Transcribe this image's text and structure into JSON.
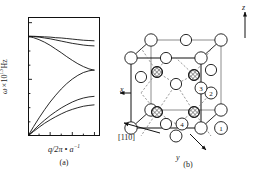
{
  "figure": {
    "panel_a_caption": "(a)",
    "panel_b_caption": "(b)"
  },
  "chart_data": {
    "type": "line",
    "title": "",
    "xlabel": "q/2π · a⁻¹",
    "ylabel": "ω × 10¹³ Hz",
    "xlim": [
      0,
      3.25
    ],
    "ylim": [
      0,
      4.2
    ],
    "grid": false,
    "legend": "none",
    "xticks": [
      1,
      2,
      3
    ],
    "xticklabels": [
      "1",
      "2",
      "3"
    ],
    "xminorticks": [
      0.5,
      1.5,
      2.5
    ],
    "yticks": [
      0,
      2,
      4
    ],
    "yticklabels": [
      "0",
      "2",
      "4"
    ],
    "yminorticks": [
      0.5,
      1,
      1.5,
      2.5,
      3,
      3.5
    ],
    "x": [
      0,
      0.25,
      0.5,
      0.75,
      1.0,
      1.25,
      1.5,
      1.75,
      2.0,
      2.25,
      2.5,
      2.75,
      3.0
    ],
    "series": [
      {
        "name": "LO",
        "branch": "optical",
        "values": [
          3.52,
          3.52,
          3.51,
          3.5,
          3.49,
          3.47,
          3.46,
          3.44,
          3.42,
          3.4,
          3.38,
          3.37,
          3.36
        ]
      },
      {
        "name": "TO-1",
        "branch": "optical",
        "values": [
          3.52,
          3.51,
          3.49,
          3.46,
          3.43,
          3.39,
          3.35,
          3.31,
          3.27,
          3.24,
          3.21,
          3.19,
          3.18
        ]
      },
      {
        "name": "TO-2",
        "branch": "optical",
        "values": [
          3.52,
          3.47,
          3.4,
          3.31,
          3.2,
          3.07,
          2.94,
          2.8,
          2.67,
          2.55,
          2.45,
          2.37,
          2.32
        ]
      },
      {
        "name": "LA",
        "branch": "acoustic",
        "values": [
          0.0,
          0.33,
          0.64,
          0.93,
          1.2,
          1.44,
          1.66,
          1.85,
          2.01,
          2.14,
          2.24,
          2.3,
          2.33
        ]
      },
      {
        "name": "TA-1",
        "branch": "acoustic",
        "values": [
          0.0,
          0.2,
          0.39,
          0.56,
          0.72,
          0.86,
          0.99,
          1.1,
          1.2,
          1.28,
          1.34,
          1.38,
          1.4
        ]
      },
      {
        "name": "TA-2",
        "branch": "acoustic",
        "values": [
          0.0,
          0.16,
          0.31,
          0.45,
          0.57,
          0.68,
          0.78,
          0.87,
          0.94,
          1.0,
          1.05,
          1.08,
          1.1
        ]
      }
    ]
  },
  "crystal": {
    "axes": {
      "z": "z",
      "x": "x",
      "y": "y"
    },
    "direction_label": "[110]",
    "atom_labels": [
      "1",
      "2",
      "3",
      "4"
    ],
    "colors": {
      "outline": "#1a1a1a",
      "open_atom_fill": "#ffffff",
      "hatched_atom_fill": "#a9a9a9",
      "bond_solid": "#1a1a1a",
      "bond_dashed": "#6b6b6b"
    }
  }
}
